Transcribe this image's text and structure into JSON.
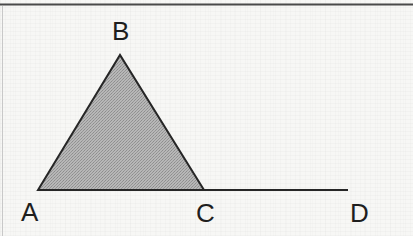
{
  "figure": {
    "kind": "geometry-diagram",
    "width": 413,
    "height": 236,
    "background_color": "#f7f7f5",
    "ink_color": "#1e1e1e",
    "shading_color": "#a8a8a8"
  },
  "borders": {
    "top_rule": {
      "y": 4,
      "x1": 0,
      "x2": 413,
      "color": "#4a4a4a",
      "thickness": 2
    },
    "left_rule": {
      "x": 2,
      "y1": 6,
      "y2": 236,
      "color": "#c8c8c8",
      "thickness": 1
    }
  },
  "points": {
    "A": {
      "label": "A",
      "x": 38,
      "y": 190
    },
    "B": {
      "label": "B",
      "x": 120,
      "y": 55
    },
    "C": {
      "label": "C",
      "x": 204,
      "y": 190
    },
    "D": {
      "label": "D",
      "x": 348,
      "y": 190
    }
  },
  "shapes": {
    "triangle": {
      "name": "triangle-ABC",
      "vertices": "38,190 120,55 204,190",
      "fill": "#a8a8a8",
      "stroke": "#262626",
      "stroke_width": 2
    },
    "baseline": {
      "name": "segment-AD",
      "x1": 38,
      "y1": 190,
      "x2": 348,
      "y2": 190,
      "stroke": "#262626",
      "stroke_width": 2
    }
  },
  "labels": {
    "B": "B",
    "A": "A",
    "C": "C",
    "D": "D"
  }
}
